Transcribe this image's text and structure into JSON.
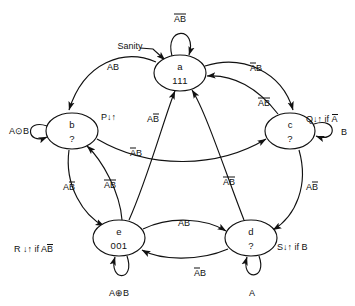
{
  "diagram": {
    "type": "state-transition-diagram",
    "title": "",
    "ink_color": "#111111",
    "background": "#ffffff",
    "states": [
      {
        "id": "a",
        "name": "a",
        "code": "111",
        "cx": 180,
        "cy": 73,
        "rx": 26,
        "ry": 18
      },
      {
        "id": "b",
        "name": "b",
        "code": "?",
        "cx": 72,
        "cy": 131,
        "rx": 26,
        "ry": 18
      },
      {
        "id": "c",
        "name": "c",
        "code": "?",
        "cx": 290,
        "cy": 131,
        "rx": 25,
        "ry": 18
      },
      {
        "id": "d",
        "name": "d",
        "code": "?",
        "cx": 251,
        "cy": 238,
        "rx": 26,
        "ry": 18
      },
      {
        "id": "e",
        "name": "e",
        "code": "001",
        "cx": 119,
        "cy": 238,
        "rx": 26,
        "ry": 18
      }
    ],
    "self_loops": [
      {
        "state": "a",
        "label": "AB",
        "bar_a": true,
        "bar_b": true,
        "position": "top"
      },
      {
        "state": "b",
        "label": "A⊙B",
        "bar_a": false,
        "bar_b": false,
        "position": "left"
      },
      {
        "state": "c",
        "label": "B",
        "bar_a": false,
        "bar_b": false,
        "position": "right"
      },
      {
        "state": "d",
        "label": "A",
        "bar_a": false,
        "bar_b": false,
        "position": "bottom"
      },
      {
        "state": "e",
        "label": "A⊕B",
        "bar_a": false,
        "bar_b": false,
        "position": "bottom"
      }
    ],
    "transitions": [
      {
        "from": "a",
        "to": "b",
        "label": "AB",
        "bar_a": false,
        "bar_b": false
      },
      {
        "from": "a",
        "to": "c",
        "label": "AB",
        "bar_a": true,
        "bar_b": false
      },
      {
        "from": "b",
        "to": "c",
        "label": "AB",
        "bar_a": true,
        "bar_b": false
      },
      {
        "from": "b",
        "to": "e",
        "label": "AB",
        "bar_a": false,
        "bar_b": true
      },
      {
        "from": "c",
        "to": "a",
        "label": "AB",
        "bar_a": true,
        "bar_b": true
      },
      {
        "from": "c",
        "to": "d",
        "label": "AB",
        "bar_a": false,
        "bar_b": true
      },
      {
        "from": "d",
        "to": "a",
        "label": "AB",
        "bar_a": true,
        "bar_b": true
      },
      {
        "from": "d",
        "to": "e",
        "label": "AB",
        "bar_a": true,
        "bar_b": false
      },
      {
        "from": "e",
        "to": "a",
        "label": "AB",
        "bar_a": false,
        "bar_b": true
      },
      {
        "from": "e",
        "to": "b",
        "label": "AB",
        "bar_a": true,
        "bar_b": true
      },
      {
        "from": "e",
        "to": "d",
        "label": "AB",
        "bar_a": false,
        "bar_b": false
      }
    ],
    "outputs": [
      {
        "state": "b",
        "text": "P↓↑",
        "cond": "",
        "cond_bar": false
      },
      {
        "state": "c",
        "text": "Q↓↑ if ",
        "cond": "A",
        "cond_bar": true
      },
      {
        "state": "d",
        "text": "S↓↑ if B",
        "cond": "",
        "cond_bar": false
      },
      {
        "state": "e",
        "text": "R ↓↑ if A",
        "cond": "B",
        "cond_bar": true
      }
    ],
    "annotations": [
      {
        "name": "sanity-reset-label",
        "text": "Sanity",
        "x": 130,
        "y": 46
      }
    ]
  }
}
